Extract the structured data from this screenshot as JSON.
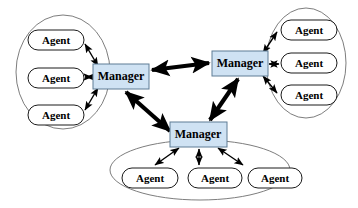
{
  "diagram": {
    "type": "node-link",
    "canvas": {
      "width": 358,
      "height": 208,
      "background": "#ffffff"
    },
    "colors": {
      "manager_fill": "#cfe2f3",
      "manager_stroke": "#5f7c95",
      "agent_fill": "#ffffff",
      "agent_stroke": "#1a1a1a",
      "ellipse_stroke": "#6e6e6e",
      "link": "#000000"
    },
    "labels": {
      "manager": "Manager",
      "agent": "Agent"
    },
    "clusters": [
      {
        "id": "cluster-left",
        "name": "left-cluster",
        "ellipse": {
          "cx": 63,
          "cy": 72,
          "rx": 47,
          "ry": 57
        },
        "manager": {
          "id": "manager-left",
          "label": "Manager",
          "x": 93,
          "y": 64,
          "w": 56,
          "h": 25
        },
        "agents": [
          {
            "id": "agent-left-1",
            "label": "Agent",
            "x": 28,
            "y": 30,
            "w": 56,
            "h": 20
          },
          {
            "id": "agent-left-2",
            "label": "Agent",
            "x": 28,
            "y": 68,
            "w": 56,
            "h": 20
          },
          {
            "id": "agent-left-3",
            "label": "Agent",
            "x": 28,
            "y": 105,
            "w": 56,
            "h": 20
          }
        ]
      },
      {
        "id": "cluster-right",
        "name": "right-cluster",
        "ellipse": {
          "cx": 306,
          "cy": 63,
          "rx": 40,
          "ry": 55
        },
        "manager": {
          "id": "manager-right",
          "label": "Manager",
          "x": 212,
          "y": 51,
          "w": 56,
          "h": 25
        },
        "agents": [
          {
            "id": "agent-right-1",
            "label": "Agent",
            "x": 281,
            "y": 20,
            "w": 56,
            "h": 20
          },
          {
            "id": "agent-right-2",
            "label": "Agent",
            "x": 281,
            "y": 53,
            "w": 56,
            "h": 20
          },
          {
            "id": "agent-right-3",
            "label": "Agent",
            "x": 281,
            "y": 85,
            "w": 56,
            "h": 20
          }
        ]
      },
      {
        "id": "cluster-bottom",
        "name": "bottom-cluster",
        "ellipse": {
          "cx": 200,
          "cy": 170,
          "rx": 90,
          "ry": 30
        },
        "manager": {
          "id": "manager-bottom",
          "label": "Manager",
          "x": 170,
          "y": 122,
          "w": 57,
          "h": 25
        },
        "agents": [
          {
            "id": "agent-bottom-1",
            "label": "Agent",
            "x": 122,
            "y": 168,
            "w": 56,
            "h": 20
          },
          {
            "id": "agent-bottom-2",
            "label": "Agent",
            "x": 188,
            "y": 168,
            "w": 54,
            "h": 20
          },
          {
            "id": "agent-bottom-3",
            "label": "Agent",
            "x": 248,
            "y": 168,
            "w": 54,
            "h": 20
          }
        ]
      }
    ],
    "links": {
      "manager_to_manager": [
        {
          "id": "link-left-right",
          "from": "manager-left",
          "to": "manager-right",
          "style": "thick",
          "arrows": "both"
        },
        {
          "id": "link-left-bottom",
          "from": "manager-left",
          "to": "manager-bottom",
          "style": "thick",
          "arrows": "both"
        },
        {
          "id": "link-right-bottom",
          "from": "manager-right",
          "to": "manager-bottom",
          "style": "thick",
          "arrows": "both"
        }
      ],
      "manager_to_agent": [
        {
          "id": "link-ml-al1",
          "from": "manager-left",
          "to": "agent-left-1",
          "style": "thin",
          "arrows": "both"
        },
        {
          "id": "link-ml-al2",
          "from": "manager-left",
          "to": "agent-left-2",
          "style": "thin",
          "arrows": "both"
        },
        {
          "id": "link-ml-al3",
          "from": "manager-left",
          "to": "agent-left-3",
          "style": "thin",
          "arrows": "both"
        },
        {
          "id": "link-mr-ar1",
          "from": "manager-right",
          "to": "agent-right-1",
          "style": "thin",
          "arrows": "both"
        },
        {
          "id": "link-mr-ar2",
          "from": "manager-right",
          "to": "agent-right-2",
          "style": "thin",
          "arrows": "both"
        },
        {
          "id": "link-mr-ar3",
          "from": "manager-right",
          "to": "agent-right-3",
          "style": "thin",
          "arrows": "both"
        },
        {
          "id": "link-mb-ab1",
          "from": "manager-bottom",
          "to": "agent-bottom-1",
          "style": "thin",
          "arrows": "both"
        },
        {
          "id": "link-mb-ab2",
          "from": "manager-bottom",
          "to": "agent-bottom-2",
          "style": "thin",
          "arrows": "both"
        },
        {
          "id": "link-mb-ab3",
          "from": "manager-bottom",
          "to": "agent-bottom-3",
          "style": "thin",
          "arrows": "both"
        }
      ]
    }
  }
}
